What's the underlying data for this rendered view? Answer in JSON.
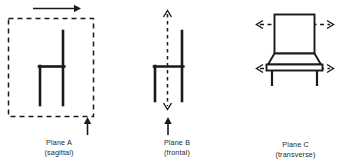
{
  "figure": {
    "background_color": "#ffffff",
    "stroke_color": "#1a1a1a",
    "panels": [
      {
        "id": "plane-a",
        "name_line": "Plane A",
        "qualifier_line": "(sagittal)",
        "plane_letter": "A",
        "plane_term": "sagittal",
        "object": "chair-side-view",
        "plane_indicator": "dashed-rectangle",
        "arrows": [
          {
            "name": "top-arrow",
            "direction": "right",
            "style": "solid"
          },
          {
            "name": "bottom-arrow",
            "direction": "up",
            "style": "solid"
          }
        ]
      },
      {
        "id": "plane-b",
        "name_line": "Plane B",
        "qualifier_line": "(frontal)",
        "plane_letter": "B",
        "plane_term": "frontal",
        "object": "chair-side-view",
        "plane_indicator": "dashed-vertical-double-arrow",
        "arrows": [
          {
            "name": "vertical-dashed-arrow",
            "direction": "up-down",
            "style": "dashed"
          },
          {
            "name": "bottom-arrow",
            "direction": "up",
            "style": "solid"
          }
        ]
      },
      {
        "id": "plane-c",
        "name_line": "Plane C",
        "qualifier_line": "(transverse)",
        "plane_letter": "C",
        "plane_term": "transverse",
        "object": "chair-front-view",
        "plane_indicator": "dashed-horizontal-double-arrows",
        "arrows": [
          {
            "name": "upper-dashed-arrow",
            "direction": "left-right",
            "style": "dashed"
          },
          {
            "name": "lower-dashed-arrow",
            "direction": "left-right",
            "style": "dashed"
          }
        ]
      }
    ]
  }
}
